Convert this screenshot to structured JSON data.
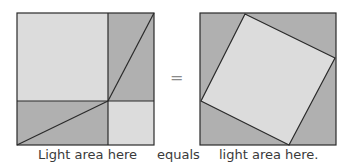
{
  "figure": {
    "captions": {
      "left": "Light area here",
      "middle": "equals",
      "right": "light area here."
    },
    "equals_sign": "=",
    "colors": {
      "light": "#dcdcdc",
      "dark": "#b0b0b0",
      "stroke": "#2a2a2a"
    },
    "left_square": {
      "description": "Square divided into a large light square (a²), a small light square (b²), and two dark rectangles each split by a diagonal into two right triangles"
    },
    "right_square": {
      "description": "Same-size square containing a tilted light square (c²) surrounded by four dark right triangles"
    }
  }
}
